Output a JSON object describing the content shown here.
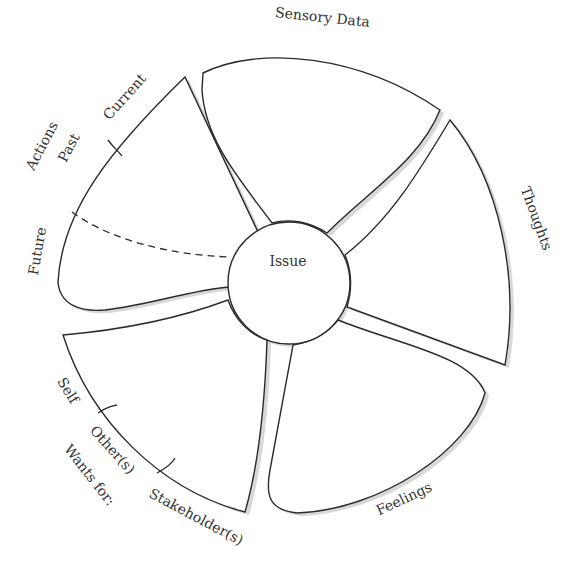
{
  "diagram": {
    "center": {
      "label": "Issue"
    },
    "petals": [
      {
        "id": "actions",
        "title": "Actions",
        "segments": [
          "Current",
          "Past",
          "Future"
        ]
      },
      {
        "id": "sensory",
        "title": "Sensory Data"
      },
      {
        "id": "thoughts",
        "title": "Thoughts"
      },
      {
        "id": "feelings",
        "title": "Feelings"
      },
      {
        "id": "wants",
        "title": "Wants for:",
        "segments": [
          "Self",
          "Other(s)",
          "Stakeholder(s)"
        ]
      }
    ]
  },
  "colors": {
    "stroke": "#2a2a2a",
    "text": "#333333",
    "shadow": "#d8d8d8",
    "background": "#ffffff"
  }
}
